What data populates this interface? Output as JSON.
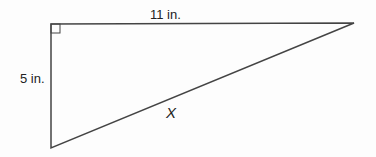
{
  "diagram": {
    "type": "right-triangle",
    "labels": {
      "top_side": "11 in.",
      "left_side": "5 in.",
      "hypotenuse": "X"
    },
    "right_angle_marker": true,
    "colors": {
      "stroke": "#444444",
      "text": "#222222"
    }
  }
}
